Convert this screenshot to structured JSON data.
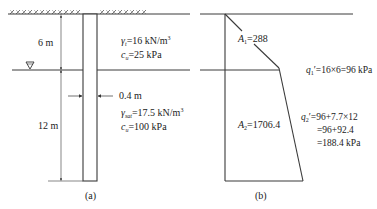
{
  "figure_a": {
    "caption": "(a)",
    "dim_upper": "6 m",
    "dim_lower": "12 m",
    "wall_width": "0.4 m",
    "layer1": {
      "gamma_sym": "γ",
      "gamma_sub": "t",
      "gamma_val": "=16 kN/m",
      "gamma_sup": "3",
      "c_sym": "c",
      "c_sub": "u",
      "c_val": "=25 kPa"
    },
    "layer2": {
      "gamma_sym": "γ",
      "gamma_sub": "sat",
      "gamma_val": "=17.5 kN/m",
      "gamma_sup": "3",
      "c_sym": "c",
      "c_sub": "u",
      "c_val": "=100 kPa"
    },
    "water_table_symbol": "▽"
  },
  "figure_b": {
    "caption": "(b)",
    "area1_sym": "A",
    "area1_sub": "1",
    "area1_val": "=288",
    "area2_sym": "A",
    "area2_sub": "2",
    "area2_val": "=1706.4",
    "q1_sym": "q",
    "q1_sub": "1",
    "q1_val": "′=16×6=96 kPa",
    "q2_sym": "q",
    "q2_sub": "2",
    "q2_line1": "′=96+7.7×12",
    "q2_line2": "=96+92.4",
    "q2_line3": "=188.4 kPa"
  },
  "colors": {
    "line": "#3a3a3a",
    "text": "#222222"
  }
}
